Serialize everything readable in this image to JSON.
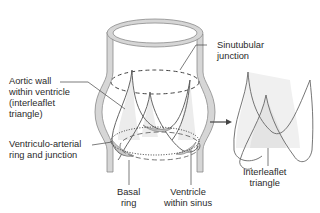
{
  "diagram": {
    "labels": {
      "sinutubular": "Sinutubular\njunction",
      "aortic_wall": "Aortic wall\nwithin ventricle\n(interleaflet\ntriangle)",
      "ventriculo_arterial": "Ventriculo-arterial\nring and junction",
      "basal_ring": "Basal\nring",
      "ventricle_within_sinus": "Ventricle\nwithin sinus",
      "interleaflet_triangle": "Interleaflet\ntriangle"
    },
    "colors": {
      "wall_fill": "#d4d4d4",
      "wall_stroke": "#8a8a8a",
      "line": "#555555",
      "triangle_fill": "#e6e6e6",
      "text": "#2a2a2a"
    }
  }
}
